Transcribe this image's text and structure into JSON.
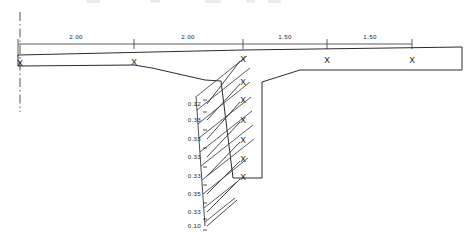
{
  "drawing": {
    "title": "Pile Cap / Slab Cross-Section",
    "units_note": "",
    "ink_color": "#2b2b2b",
    "background_color": "#ffffff"
  },
  "dimension_line": {
    "name": "top-dimension-chain",
    "y": 44,
    "x_start": 18,
    "x_end": 412,
    "tick_half_height": 5,
    "ticks": [
      18,
      134,
      243,
      327,
      412
    ],
    "segments": [
      {
        "label": "2.00",
        "x_from": 18,
        "x_to": 134,
        "label_x": 76,
        "label_y": 37
      },
      {
        "label": "2.00",
        "x_from": 134,
        "x_to": 243,
        "label_x": 188,
        "label_y": 37
      },
      {
        "label": "1.50",
        "x_from": 243,
        "x_to": 327,
        "label_x": 285,
        "label_y": 37
      },
      {
        "label": "1.50",
        "x_from": 327,
        "x_to": 412,
        "label_x": 370,
        "label_y": 37
      }
    ]
  },
  "centerline": {
    "name": "left-centerline",
    "x": 20,
    "y_top": 12,
    "y_bottom": 112
  },
  "slab": {
    "name": "slab-profile",
    "top_edge": "M 18,55 L 243,50 L 462,47",
    "right_edge": "M 462,47 L 462,70",
    "bottom_edge_right": "M 462,70 L 300,70 L 262,82 L 236,81",
    "bottom_edge_left": "M 18,66 L 134,65 L 152,68 L 205,80 L 221,81"
  },
  "shaft": {
    "name": "pile-shaft",
    "outline": "M 221,81 L 233,178 L 262,178 L 262,82",
    "left_top_x": 221,
    "right_top_x": 243
  },
  "hatch_zone": {
    "name": "hatched-embankment",
    "boundary": "M 196,80 L 205,80 L 221,81 L 233,178 L 196,178 Z",
    "line_count": 9,
    "angle_note": "diagonal up-right"
  },
  "x_markers": {
    "name": "station-x-markers",
    "glyph": "X",
    "slab_row": [
      {
        "id": "x-left-end",
        "x": 20,
        "y": 64
      },
      {
        "id": "x-station-2",
        "x": 134,
        "y": 63
      },
      {
        "id": "x-shaft-top",
        "x": 243,
        "y": 60
      },
      {
        "id": "x-station-4",
        "x": 327,
        "y": 61
      },
      {
        "id": "x-station-5",
        "x": 412,
        "y": 61
      }
    ],
    "shaft_column": [
      {
        "id": "x-depth-1",
        "x": 243,
        "y": 60
      },
      {
        "id": "x-depth-2",
        "x": 243,
        "y": 83
      },
      {
        "id": "x-depth-3",
        "x": 243,
        "y": 101
      },
      {
        "id": "x-depth-4",
        "x": 243,
        "y": 121
      },
      {
        "id": "x-depth-5",
        "x": 243,
        "y": 141
      },
      {
        "id": "x-depth-6",
        "x": 243,
        "y": 160
      },
      {
        "id": "x-depth-7",
        "x": 243,
        "y": 178
      }
    ]
  },
  "depth_labels": {
    "name": "depth-dimension-column",
    "text_x": 201,
    "items": [
      {
        "value": "0.12",
        "y": 104,
        "leader_to_x": 243,
        "leader_to_y": 60
      },
      {
        "value": "0.33",
        "y": 120,
        "leader_to_x": 243,
        "leader_to_y": 83
      },
      {
        "value": "0.33",
        "y": 139,
        "leader_to_x": 243,
        "leader_to_y": 101
      },
      {
        "value": "0.33",
        "y": 157,
        "leader_to_x": 243,
        "leader_to_y": 121
      },
      {
        "value": "0.33",
        "y": 176,
        "leader_to_x": 243,
        "leader_to_y": 141
      },
      {
        "value": "0.35",
        "y": 194,
        "leader_to_x": 243,
        "leader_to_y": 160
      },
      {
        "value": "0.33",
        "y": 212,
        "leader_to_x": 243,
        "leader_to_y": 178
      },
      {
        "value": "0.10",
        "y": 226,
        "leader_to_x": 240,
        "leader_to_y": 182
      }
    ],
    "tick_x_left": 203,
    "tick_x_right": 207
  }
}
